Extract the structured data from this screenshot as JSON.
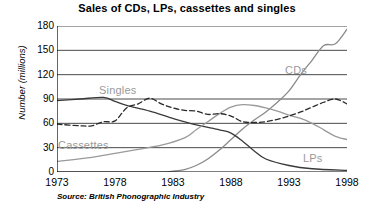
{
  "chart_data": {
    "type": "line",
    "title": "Sales of CDs, LPs, cassettes and singles",
    "xlabel": "",
    "ylabel": "Number (millions)",
    "source": "Source: British Phonographic Industry",
    "xlim": [
      1973,
      1998
    ],
    "ylim": [
      0,
      180
    ],
    "xticks": [
      1973,
      1978,
      1983,
      1988,
      1993,
      1998
    ],
    "yticks": [
      0,
      30,
      60,
      90,
      120,
      150,
      180
    ],
    "grid": "horizontal",
    "legend_position": "inline-labels",
    "series": [
      {
        "name": "CDs",
        "label": "CDs",
        "style": "solid",
        "color": "#8a8a8a",
        "x": [
          1973,
          1978,
          1982,
          1983,
          1984,
          1985,
          1986,
          1987,
          1988,
          1989,
          1990,
          1991,
          1992,
          1993,
          1994,
          1995,
          1996,
          1997,
          1998
        ],
        "values": [
          0,
          0,
          0,
          1,
          3,
          8,
          16,
          27,
          40,
          53,
          64,
          74,
          86,
          100,
          120,
          138,
          156,
          158,
          176
        ]
      },
      {
        "name": "LPs",
        "label": "LPs",
        "style": "solid",
        "color": "#3a3a3a",
        "x": [
          1973,
          1975,
          1977,
          1978,
          1979,
          1981,
          1983,
          1985,
          1987,
          1988,
          1989,
          1990,
          1991,
          1993,
          1995,
          1998
        ],
        "values": [
          88,
          90,
          92,
          87,
          82,
          75,
          66,
          58,
          52,
          48,
          38,
          26,
          16,
          8,
          4,
          2
        ]
      },
      {
        "name": "Cassettes",
        "label": "Cassettes",
        "style": "solid",
        "color": "#9a9a9a",
        "x": [
          1973,
          1976,
          1978,
          1980,
          1982,
          1984,
          1985,
          1986,
          1987,
          1988,
          1989,
          1990,
          1991,
          1992,
          1993,
          1994,
          1995,
          1996,
          1997,
          1998
        ],
        "values": [
          13,
          18,
          23,
          28,
          33,
          42,
          52,
          62,
          72,
          80,
          83,
          82,
          79,
          75,
          70,
          66,
          60,
          52,
          44,
          40
        ]
      },
      {
        "name": "Singles",
        "label": "Singles",
        "style": "dashed",
        "color": "#2a2a2a",
        "x": [
          1973,
          1975,
          1976,
          1977,
          1978,
          1979,
          1980,
          1981,
          1982,
          1983,
          1984,
          1985,
          1986,
          1987,
          1988,
          1989,
          1990,
          1991,
          1992,
          1993,
          1994,
          1995,
          1996,
          1997,
          1998
        ],
        "values": [
          59,
          57,
          57,
          62,
          63,
          79,
          84,
          91,
          84,
          79,
          76,
          75,
          71,
          72,
          69,
          62,
          61,
          62,
          65,
          69,
          74,
          80,
          86,
          90,
          84
        ]
      }
    ],
    "series_label_positions": [
      {
        "name": "CDs",
        "x": 285,
        "y": 64
      },
      {
        "name": "LPs",
        "x": 303,
        "y": 152
      },
      {
        "name": "Cassettes",
        "x": 58,
        "y": 139
      },
      {
        "name": "Singles",
        "x": 99,
        "y": 84
      }
    ]
  }
}
